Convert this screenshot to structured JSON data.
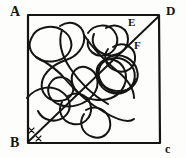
{
  "figure": {
    "type": "hand-drawn-geometry-diagram",
    "background_color": "#fdfdfb",
    "ink_color": "#141414",
    "labels": {
      "a": "A",
      "b": "B",
      "c": "c",
      "d": "D",
      "e": "E",
      "f": "F"
    },
    "square": {
      "left": 27,
      "top": 14,
      "right": 160,
      "bottom": 143,
      "stroke_width": 2.2
    },
    "diagonal": {
      "from": "B",
      "to": "D",
      "x1": 29,
      "y1": 141,
      "x2": 159,
      "y2": 16,
      "stroke_width": 1.9
    },
    "angle_marks": [
      {
        "name": "x-mark-upper",
        "x": 31,
        "y": 130,
        "text": "x"
      },
      {
        "name": "x-mark-lower",
        "x": 38,
        "y": 139,
        "text": "x"
      }
    ],
    "point_markers": [
      {
        "name": "point-e",
        "label": "E",
        "x": 131,
        "y": 22
      },
      {
        "name": "point-f",
        "label": "F",
        "x": 137,
        "y": 45
      }
    ],
    "tangle": {
      "name": "scribbled-closed-curve",
      "stroke_width": 2.0,
      "paths": [
        "M 32 37 C 36 27, 52 24, 62 30 C 72 36, 74 46, 68 54 C 61 63, 44 64, 36 57 C 29 51, 28 44, 32 37 Z",
        "M 60 26 C 70 19, 82 24, 84 35 C 86 47, 76 57, 66 60 C 54 64, 44 72, 42 82",
        "M 42 82 C 40 93, 48 101, 58 101 C 70 101, 76 92, 72 84 C 68 76, 56 75, 51 82 C 45 90, 49 100, 58 104 C 70 110, 86 104, 93 95",
        "M 93 95 C 101 85, 98 72, 88 68 C 78 64, 70 72, 72 82 C 74 93, 86 99, 97 100 C 110 101, 120 95, 124 86",
        "M 124 86 C 129 75, 124 63, 114 60 C 103 57, 95 65, 97 75 C 99 86, 111 92, 122 91",
        "M 122 91 C 133 90, 140 80, 137 70 C 134 59, 122 53, 112 56 C 101 59, 96 70, 100 80",
        "M 100 80 C 105 91, 118 96, 127 90 C 137 84, 137 70, 129 63 C 120 55, 106 57, 100 66",
        "M 100 66 C 94 76, 99 88, 109 92 C 121 97, 133 90, 135 79",
        "M 88 33 C 94 24, 108 23, 114 31 C 121 40, 116 52, 106 55 C 95 58, 86 50, 88 40",
        "M 106 28 C 116 22, 128 28, 128 39 C 128 50, 118 57, 108 55 C 96 53, 90 43, 94 34",
        "M 113 47 C 122 41, 134 46, 135 56 C 136 67, 127 74, 117 71 C 106 68, 102 57, 108 49",
        "M 27 98 C 37 86, 52 85, 62 92 C 72 99, 72 111, 64 117 C 55 124, 42 120, 38 111",
        "M 68 96 C 78 90, 90 96, 91 107 C 92 118, 83 126, 73 124 C 62 122, 57 111, 62 102",
        "M 86 110 C 96 104, 108 110, 110 121 C 112 132, 103 140, 93 137 C 82 134, 78 123, 84 114",
        "M 36 57 C 46 62, 58 70, 66 80 C 76 92, 90 104, 104 112 C 116 119, 128 124, 134 119",
        "M 62 30 C 58 42, 62 56, 70 68 C 80 83, 94 96, 108 104",
        "M 84 35 C 92 47, 104 60, 116 70 C 126 78, 134 88, 134 98"
      ]
    }
  }
}
